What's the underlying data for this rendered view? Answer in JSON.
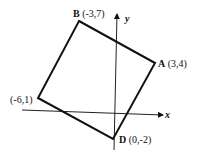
{
  "diagram": {
    "type": "coordinate-geometry",
    "axes": {
      "x_label": "x",
      "y_label": "y"
    },
    "vertices": [
      {
        "name": "B",
        "coords": "(-3,7)",
        "x": -3,
        "y": 7
      },
      {
        "name": "A",
        "coords": "(3,4)",
        "x": 3,
        "y": 4
      },
      {
        "name": "",
        "coords": "(-6,1)",
        "x": -6,
        "y": 1
      },
      {
        "name": "D",
        "coords": "(0,-2)",
        "x": 0,
        "y": -2
      }
    ],
    "colors": {
      "stroke": "#111111",
      "background": "#ffffff"
    }
  }
}
